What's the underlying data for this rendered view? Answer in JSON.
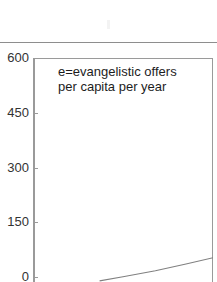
{
  "figure": {
    "kind": "chart-crop",
    "background_color": "#ffffff",
    "rule_color": "#8e8e8e",
    "frame_color": "#9a9a9a",
    "text_color": "#1d1d1d",
    "line_color": "#808080"
  },
  "annotation": {
    "line1": "e=evangelistic offers",
    "line2": "per capita per year"
  },
  "axis": {
    "y_ticks": [
      "600",
      "450",
      "300",
      "150",
      "0"
    ]
  },
  "chart_data": {
    "type": "line",
    "title": "",
    "subtitle": "",
    "xlabel": "",
    "ylabel": "",
    "annotations": [
      "e=evangelistic offers per capita per year"
    ],
    "legend": [],
    "legend_position": "none",
    "grid": false,
    "ylim": [
      0,
      600
    ],
    "ytick_values": [
      600,
      450,
      300,
      150,
      0
    ],
    "ytick_labels": [
      "600",
      "450",
      "300",
      "150",
      "0"
    ],
    "xlim": [
      0,
      1
    ],
    "xtick_values": [],
    "xtick_labels": [],
    "series": [
      {
        "name": "e",
        "x": [
          0.37,
          0.5,
          0.68,
          0.85,
          1.0
        ],
        "values": [
          3,
          14,
          30,
          48,
          65
        ]
      }
    ],
    "note": "Image is a crop; the curve enters the visible area near the lower-left and rises to the right edge, clipped by the image border."
  }
}
